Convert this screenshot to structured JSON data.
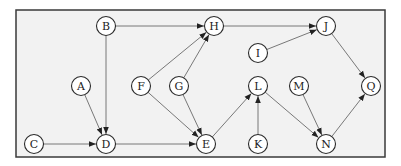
{
  "diagram": {
    "type": "directed-graph",
    "frame": {
      "x": 16,
      "y": 10,
      "width": 369,
      "height": 147
    },
    "node_radius": 9.5,
    "colors": {
      "background": "#f2f2f2",
      "frame": "#3a3a3a",
      "edge": "#6a6a6a",
      "node_fill": "#ffffff",
      "node_stroke": "#2a2a2a",
      "text": "#222222"
    },
    "nodes": [
      {
        "id": "A",
        "label": "A",
        "x": 81,
        "y": 86
      },
      {
        "id": "B",
        "label": "B",
        "x": 106,
        "y": 26
      },
      {
        "id": "C",
        "label": "C",
        "x": 34,
        "y": 144
      },
      {
        "id": "D",
        "label": "D",
        "x": 106,
        "y": 144
      },
      {
        "id": "E",
        "label": "E",
        "x": 206,
        "y": 144
      },
      {
        "id": "F",
        "label": "F",
        "x": 141,
        "y": 86
      },
      {
        "id": "G",
        "label": "G",
        "x": 179,
        "y": 86
      },
      {
        "id": "H",
        "label": "H",
        "x": 214,
        "y": 26
      },
      {
        "id": "I",
        "label": "I",
        "x": 258,
        "y": 53
      },
      {
        "id": "J",
        "label": "J",
        "x": 326,
        "y": 26
      },
      {
        "id": "K",
        "label": "K",
        "x": 258,
        "y": 144
      },
      {
        "id": "L",
        "label": "L",
        "x": 258,
        "y": 86
      },
      {
        "id": "M",
        "label": "M",
        "x": 299,
        "y": 86
      },
      {
        "id": "N",
        "label": "N",
        "x": 326,
        "y": 144
      },
      {
        "id": "Q",
        "label": "Q",
        "x": 371,
        "y": 86
      }
    ],
    "edges": [
      {
        "from": "B",
        "to": "H"
      },
      {
        "from": "B",
        "to": "D"
      },
      {
        "from": "A",
        "to": "D"
      },
      {
        "from": "C",
        "to": "D"
      },
      {
        "from": "D",
        "to": "E"
      },
      {
        "from": "F",
        "to": "H"
      },
      {
        "from": "G",
        "to": "H"
      },
      {
        "from": "F",
        "to": "E"
      },
      {
        "from": "G",
        "to": "E"
      },
      {
        "from": "H",
        "to": "J"
      },
      {
        "from": "I",
        "to": "J"
      },
      {
        "from": "E",
        "to": "L"
      },
      {
        "from": "K",
        "to": "L"
      },
      {
        "from": "L",
        "to": "N"
      },
      {
        "from": "M",
        "to": "N"
      },
      {
        "from": "J",
        "to": "Q"
      },
      {
        "from": "N",
        "to": "Q"
      }
    ]
  }
}
